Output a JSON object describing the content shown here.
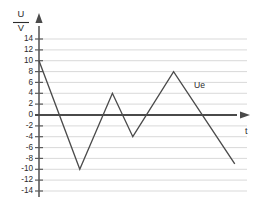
{
  "chart_data": {
    "type": "line",
    "title": "",
    "xlabel": "t",
    "ylabel": "U/V",
    "ylabel_numerator": "U",
    "ylabel_denominator": "V",
    "ylim": [
      -15,
      15
    ],
    "xlim": [
      0,
      10.2
    ],
    "grid": true,
    "grid_axis": "y",
    "legend": "inline-annotation",
    "y_ticks": [
      14,
      12,
      10,
      8,
      6,
      4,
      2,
      0,
      -2,
      -4,
      -6,
      -8,
      -10,
      -12,
      -14
    ],
    "y_tick_labels": [
      "14",
      "12",
      "10",
      "8",
      "6",
      "4",
      "2",
      "0",
      "-2",
      "-4",
      "-6",
      "-8",
      "-10",
      "-12",
      "-14"
    ],
    "x_ticks": [],
    "x_tick_labels": [],
    "series": [
      {
        "name": "Ue",
        "annotation": "Ue",
        "color": "#4b4b4b",
        "x": [
          0.0,
          2.0,
          3.6,
          4.6,
          6.6,
          9.6
        ],
        "values": [
          10,
          -10,
          4,
          -4,
          8,
          -9
        ],
        "points": [
          {
            "x": 0.0,
            "y": 10
          },
          {
            "x": 2.0,
            "y": -10
          },
          {
            "x": 3.6,
            "y": 4
          },
          {
            "x": 4.6,
            "y": -4
          },
          {
            "x": 6.6,
            "y": 8
          },
          {
            "x": 9.6,
            "y": -9
          }
        ]
      }
    ],
    "annotations": [
      {
        "text": "Ue",
        "x": 7.55,
        "y": 5.6
      }
    ],
    "axis_arrows": {
      "x": true,
      "y": true
    }
  },
  "colors": {
    "background": "#ffffff",
    "gridline": "#c9c9c9",
    "axis": "#5a5a5a",
    "zero_axis": "#4a4a4a",
    "curve": "#4b4b4b",
    "text": "#2b2b2b"
  }
}
